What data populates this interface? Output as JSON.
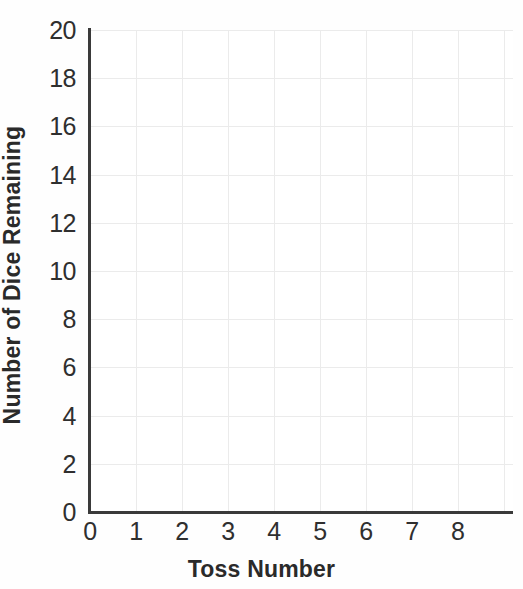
{
  "chart_data": {
    "type": "line",
    "title": "",
    "subtitle": "",
    "xlabel": "Toss Number",
    "ylabel": "Number of Dice Remaining",
    "xlim": [
      0,
      9.2
    ],
    "ylim": [
      0,
      20
    ],
    "x_ticks": [
      0,
      1,
      2,
      3,
      4,
      5,
      6,
      7,
      8
    ],
    "x_tick_labels": [
      "0",
      "1",
      "2",
      "3",
      "4",
      "5",
      "6",
      "7",
      "8"
    ],
    "y_ticks": [
      0,
      2,
      4,
      6,
      8,
      10,
      12,
      14,
      16,
      18,
      20
    ],
    "y_tick_labels": [
      "0",
      "2",
      "4",
      "6",
      "8",
      "10",
      "12",
      "14",
      "16",
      "18",
      "20"
    ],
    "grid": true,
    "grid_color": "#ebebeb",
    "grid_x_step": 1,
    "grid_y_step": 2,
    "legend": null,
    "legend_position": "none",
    "series": [],
    "values": [],
    "categories": [],
    "annotations": [],
    "note": "Empty plotting grid — no data series are drawn on the axes."
  },
  "axes": {
    "y_title": "Number of Dice Remaining",
    "x_title": "Toss Number",
    "spine_color": "#3a3a3a",
    "tick_label_color": "#2f2f2f",
    "title_color": "#2a2a2a"
  },
  "ticks": {
    "y": [
      "20",
      "18",
      "16",
      "14",
      "12",
      "10",
      "8",
      "6",
      "4",
      "2",
      "0"
    ],
    "x": [
      "0",
      "1",
      "2",
      "3",
      "4",
      "5",
      "6",
      "7",
      "8"
    ]
  },
  "colors": {
    "background": "#fefefe",
    "plot_background": "#ffffff",
    "grid": "#ebebeb",
    "axis": "#3a3a3a",
    "text": "#2a2a2a"
  }
}
